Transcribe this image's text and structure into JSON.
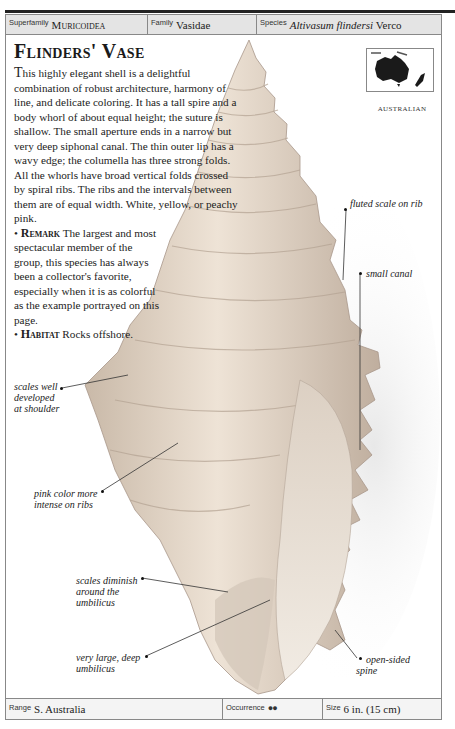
{
  "running_head": "ESSENTIAL SHELLS",
  "header": {
    "superfamily_label": "Superfamily",
    "superfamily_value": "Muricoidea",
    "family_label": "Family",
    "family_value": "Vasidae",
    "species_label": "Species",
    "species_value": "Altivasum flindersi",
    "species_author": "Verco"
  },
  "title": "Flinders' Vase",
  "description": {
    "dropcap": "T",
    "paragraph": "his highly elegant shell is a delightful combination of robust architecture, harmony of line, and delicate coloring. It has a tall spire and a body whorl of about equal height; the suture is shallow. The small aperture ends in a narrow but very deep siphonal canal. The thin outer lip has a wavy edge; the columella has three strong folds. All the whorls have broad vertical folds crossed by spiral ribs. The ribs and the intervals between them are of equal width. White, yellow, or peachy pink.",
    "remark_label": "Remark",
    "remark_text": "The largest and most spectacular member of the group, this species has always been a collector's favorite, especially when it is as colorful as the example portrayed on this page.",
    "habitat_label": "Habitat",
    "habitat_text": "Rocks offshore."
  },
  "map": {
    "label": "AUSTRALIAN"
  },
  "callouts": {
    "fluted": "fluted scale on rib",
    "canal": "small canal",
    "shoulder": "scales well developed at shoulder",
    "pink": "pink color more intense on ribs",
    "diminish": "scales diminish around the umbilicus",
    "umbilicus": "very large, deep umbilicus",
    "spine": "open-sided spine"
  },
  "footer": {
    "range_label": "Range",
    "range_value": "S. Australia",
    "occurrence_label": "Occurrence",
    "occurrence_icon": "footprints-icon",
    "size_label": "Size",
    "size_value": "6 in. (15 cm)"
  },
  "colors": {
    "header_bg": "#e4e4e4",
    "border": "#888888",
    "text": "#222222"
  }
}
